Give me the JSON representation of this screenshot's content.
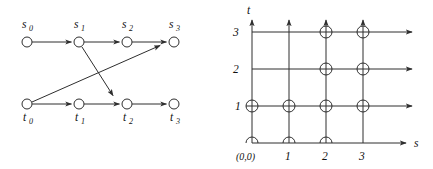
{
  "figure": {
    "background_color": "#ffffff",
    "ink_color": "#2e2e2e",
    "panels": [
      {
        "id": "transition-graph",
        "name": "two-row-transition-graph"
      },
      {
        "id": "lattice-grid",
        "name": "s-t-lattice-grid"
      }
    ]
  },
  "transition_graph": {
    "top_row": {
      "label_position": "above",
      "nodes": [
        {
          "key": "s0",
          "base": "s",
          "sub": "0",
          "x": 27,
          "y": 42
        },
        {
          "key": "s1",
          "base": "s",
          "sub": "1",
          "x": 79,
          "y": 42
        },
        {
          "key": "s2",
          "base": "s",
          "sub": "2",
          "x": 127,
          "y": 42
        },
        {
          "key": "s3",
          "base": "s",
          "sub": "3",
          "x": 174,
          "y": 42
        }
      ]
    },
    "bottom_row": {
      "label_position": "below",
      "nodes": [
        {
          "key": "t0",
          "base": "t",
          "sub": "0",
          "x": 27,
          "y": 104
        },
        {
          "key": "t1",
          "base": "t",
          "sub": "1",
          "x": 79,
          "y": 104
        },
        {
          "key": "t2",
          "base": "t",
          "sub": "2",
          "x": 127,
          "y": 104
        },
        {
          "key": "t3",
          "base": "t",
          "sub": "3",
          "x": 174,
          "y": 104
        }
      ]
    },
    "edges": [
      {
        "from": "s0",
        "to": "s1",
        "kind": "horizontal"
      },
      {
        "from": "s1",
        "to": "s2",
        "kind": "horizontal"
      },
      {
        "from": "s2",
        "to": "s3",
        "kind": "horizontal"
      },
      {
        "from": "t0",
        "to": "t1",
        "kind": "horizontal"
      },
      {
        "from": "t1",
        "to": "t2",
        "kind": "horizontal"
      },
      {
        "from": "t2",
        "to": "t3",
        "kind": "horizontal"
      },
      {
        "from": "s1",
        "to": "t2",
        "kind": "diagonal-down"
      },
      {
        "from": "t0",
        "to": "s3",
        "kind": "diagonal-up"
      }
    ],
    "node_radius": 5
  },
  "lattice": {
    "axes": {
      "x_label": "s",
      "y_label": "t",
      "origin_label": "(0,0)",
      "x_ticks": [
        "1",
        "2",
        "3"
      ],
      "y_ticks": [
        "1",
        "2",
        "3"
      ]
    },
    "grid": {
      "s_values": [
        0,
        1,
        2,
        3
      ],
      "t_values": [
        0,
        1,
        2,
        3
      ],
      "origin_px": {
        "x": 36,
        "y": 143
      },
      "step_px": 37
    },
    "nodes": [
      {
        "s": 0,
        "t": 0,
        "marker": "circle-clipped"
      },
      {
        "s": 1,
        "t": 0,
        "marker": "circle-clipped"
      },
      {
        "s": 2,
        "t": 0,
        "marker": "circle-clipped"
      },
      {
        "s": 0,
        "t": 1,
        "marker": "crossed-circle"
      },
      {
        "s": 1,
        "t": 1,
        "marker": "crossed-circle"
      },
      {
        "s": 2,
        "t": 1,
        "marker": "crossed-circle"
      },
      {
        "s": 3,
        "t": 1,
        "marker": "crossed-circle"
      },
      {
        "s": 2,
        "t": 2,
        "marker": "crossed-circle"
      },
      {
        "s": 3,
        "t": 2,
        "marker": "crossed-circle"
      },
      {
        "s": 2,
        "t": 3,
        "marker": "crossed-circle"
      },
      {
        "s": 3,
        "t": 3,
        "marker": "crossed-circle"
      }
    ],
    "horizontal_rays": [
      {
        "t": 0,
        "arrow": true
      },
      {
        "t": 1,
        "arrow": true
      },
      {
        "t": 2,
        "arrow": true
      },
      {
        "t": 3,
        "arrow": true
      }
    ],
    "vertical_rays": [
      {
        "s": 0,
        "arrow": true
      },
      {
        "s": 1,
        "arrow": true
      },
      {
        "s": 2,
        "arrow": true
      },
      {
        "s": 3,
        "arrow": true
      }
    ],
    "node_radius": 6
  }
}
